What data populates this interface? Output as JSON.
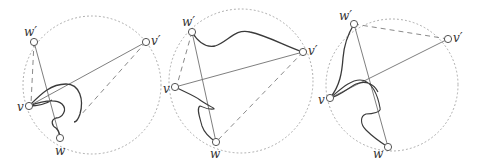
{
  "figure": {
    "panels": [
      {
        "id": "panel-1",
        "labels": {
          "w_prime": "w′",
          "v_prime": "v′",
          "v": "v",
          "w": "w"
        },
        "dashed_edges": [
          "w′–v",
          "v′–w"
        ],
        "solid_edges": [
          "v–v′",
          "w′–w"
        ],
        "curve": "loop from v through interior, around and back"
      },
      {
        "id": "panel-2",
        "labels": {
          "w_prime": "w′",
          "v_prime": "v′",
          "v": "v",
          "w": "w"
        },
        "dashed_edges": [
          "w′–v",
          "v′–w"
        ],
        "solid_edges": [
          "v–v′",
          "w′–w"
        ],
        "curve": "wavy curve w′ to v′, zigzag from v toward w"
      },
      {
        "id": "panel-3",
        "labels": {
          "w_prime": "w′",
          "v_prime": "v′",
          "v": "v",
          "w": "w"
        },
        "dashed_edges": [
          "w′–v′"
        ],
        "solid_edges": [
          "v–v′",
          "w′–w"
        ],
        "curve": "curve w′ to v, and looping curve from v"
      }
    ],
    "colors": {
      "circle": "#a8a8a8",
      "edge": "#707070",
      "curve": "#3a3a3a",
      "vertex_fill": "#ffffff"
    }
  }
}
